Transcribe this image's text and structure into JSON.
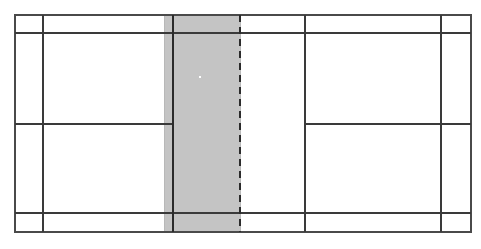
{
  "figure": {
    "kind": "court-diagram",
    "sport": "badminton",
    "view": "top-down",
    "background_color": "#ffffff",
    "canvas": {
      "width": 481,
      "height": 249
    }
  },
  "colors": {
    "line": "#3a3a3a",
    "line_outer": "#4a4a4a",
    "shaded_fill": "#c4c4c4",
    "shaded_edge": "#b8b8b8",
    "net_line": "#2b2b2b",
    "dashed_line": "#2b2b2b",
    "marker": "#ffffff",
    "background": "#ffffff"
  },
  "geometry": {
    "outer_boundary": {
      "x1": 15,
      "y1": 15,
      "x2": 471,
      "y2": 232
    },
    "sideline_left": {
      "x": 43,
      "y1": 15,
      "y2": 232
    },
    "sideline_right": {
      "x": 441,
      "y1": 15,
      "y2": 232
    },
    "long_service_line_top": {
      "y": 33,
      "x1": 15,
      "x2": 471
    },
    "long_service_line_bottom": {
      "y": 213,
      "x1": 15,
      "x2": 471
    },
    "centre_line_left": {
      "y": 124,
      "x1": 15,
      "x2": 173
    },
    "centre_line_right": {
      "y": 124,
      "x1": 305,
      "x2": 471
    },
    "short_service_line_right": {
      "x": 305,
      "y1": 15,
      "y2": 232
    },
    "net_line": {
      "x": 173,
      "y1": 15,
      "y2": 232
    },
    "dashed_line": {
      "x": 240,
      "y1": 15,
      "y2": 232
    },
    "shaded_band": {
      "x1": 164,
      "x2": 240,
      "y1": 15,
      "y2": 232
    },
    "marker_dot": {
      "cx": 200,
      "cy": 77,
      "r": 1.6
    }
  },
  "strokes": {
    "outer_width": 2.2,
    "inner_width": 1.9,
    "net_width": 2.2,
    "dashed_width": 2.4,
    "dash_pattern": "7 5"
  },
  "labels": {
    "net": "net",
    "shaded_zone": "shaded-zone",
    "marker": "shuttle-marker"
  }
}
